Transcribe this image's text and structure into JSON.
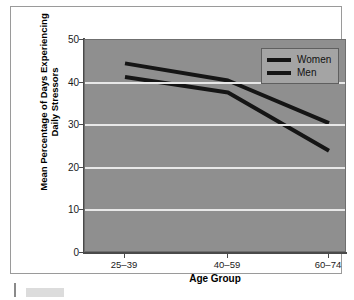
{
  "chart_data": {
    "type": "line",
    "title": "",
    "xlabel": "Age Group",
    "ylabel": "Mean Percentage of Days Experiencing Daily Stressors",
    "ylabel_line1": "Mean Percentage of Days Experiencing",
    "ylabel_line2": "Daily Stressors",
    "categories": [
      "25–39",
      "40–59",
      "60–74"
    ],
    "series": [
      {
        "name": "Women",
        "values": [
          44.5,
          40.5,
          30.5
        ]
      },
      {
        "name": "Men",
        "values": [
          41.3,
          37.7,
          24.0
        ]
      }
    ],
    "ylim": [
      0,
      50
    ],
    "yticks": [
      0,
      10,
      20,
      30,
      40,
      50
    ],
    "ytick_labels": [
      "0",
      "10",
      "20",
      "30",
      "40",
      "50"
    ],
    "gridlines": [
      10,
      20,
      30,
      40
    ],
    "grid": true,
    "legend_position": "top-right",
    "colors": {
      "plot_background": "#8f8f8f",
      "gridline": "#e8e8e8",
      "line": "#151515",
      "axis": "#4a4a4a",
      "legend_background": "#a4a4a4",
      "figure_background": "#ffffff",
      "frame_border": "#9a9a9a"
    }
  },
  "legend": {
    "entries": [
      {
        "label": "Women"
      },
      {
        "label": "Men"
      }
    ]
  },
  "axes": {
    "y": {
      "tick_labels": [
        "50",
        "40",
        "30",
        "20",
        "10",
        "0"
      ],
      "title_line1": "Mean Percentage of Days Experiencing",
      "title_line2": "Daily Stressors"
    },
    "x": {
      "tick_labels": [
        "25–39",
        "40–59",
        "60–74"
      ],
      "title": "Age Group"
    }
  }
}
